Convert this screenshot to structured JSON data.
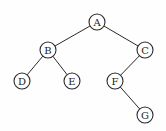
{
  "diagram": {
    "type": "binary-tree",
    "nodes": [
      {
        "id": "A",
        "label": "A",
        "x": 97,
        "y": 22
      },
      {
        "id": "B",
        "label": "B",
        "x": 48,
        "y": 50
      },
      {
        "id": "C",
        "label": "C",
        "x": 145,
        "y": 50
      },
      {
        "id": "D",
        "label": "D",
        "x": 22,
        "y": 81
      },
      {
        "id": "E",
        "label": "E",
        "x": 72,
        "y": 81
      },
      {
        "id": "F",
        "label": "F",
        "x": 115,
        "y": 81
      },
      {
        "id": "G",
        "label": "G",
        "x": 145,
        "y": 115
      }
    ],
    "edges": [
      {
        "from": "A",
        "to": "B"
      },
      {
        "from": "A",
        "to": "C"
      },
      {
        "from": "B",
        "to": "D"
      },
      {
        "from": "B",
        "to": "E"
      },
      {
        "from": "C",
        "to": "F"
      },
      {
        "from": "F",
        "to": "G"
      }
    ],
    "node_radius": 8
  }
}
